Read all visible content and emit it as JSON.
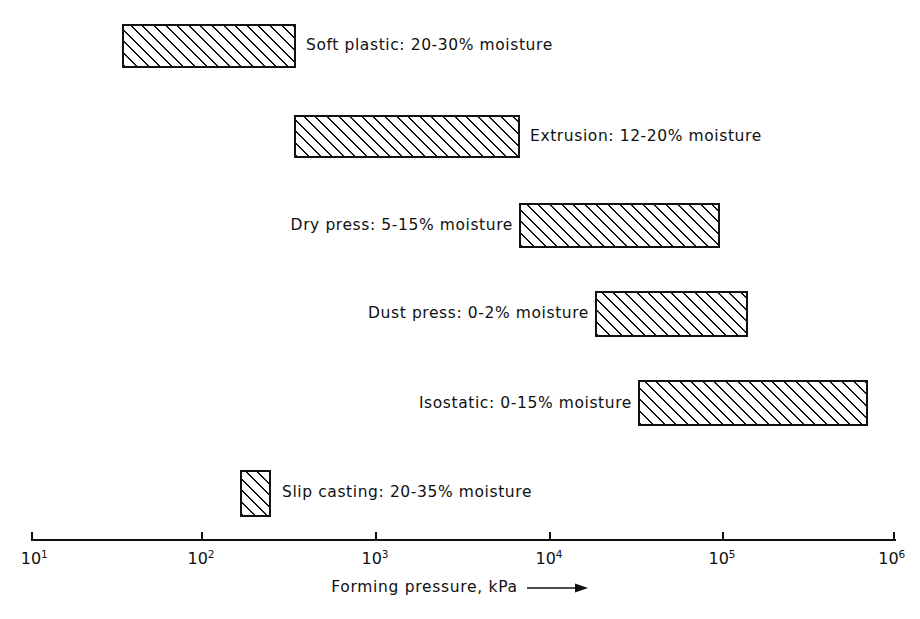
{
  "chart_data": {
    "type": "bar",
    "orientation": "horizontal",
    "title": "",
    "subtitle": "",
    "xlabel": "Forming pressure, kPa ⟶",
    "ylabel": "",
    "xscale": "log",
    "xlim": [
      10,
      1000000
    ],
    "grid": false,
    "legend": null,
    "xticks": [
      {
        "value": 10,
        "mantissa": "10",
        "exponent": "1",
        "px": 31
      },
      {
        "value": 100,
        "mantissa": "10",
        "exponent": "2",
        "px": 201
      },
      {
        "value": 1000,
        "mantissa": "10",
        "exponent": "3",
        "px": 375
      },
      {
        "value": 10000,
        "mantissa": "10",
        "exponent": "4",
        "px": 549
      },
      {
        "value": 100000,
        "mantissa": "10",
        "exponent": "5",
        "px": 722
      },
      {
        "value": 1000000,
        "mantissa": "10",
        "exponent": "6",
        "px": 895
      }
    ],
    "categories": [
      "Soft plastic",
      "Extrusion",
      "Dry press",
      "Dust press",
      "Isostatic",
      "Slip casting"
    ],
    "bars": [
      {
        "label": "Soft plastic: 20-30% moisture",
        "process": "Soft plastic",
        "moisture": "20-30%",
        "pressure_min_kpa": 34,
        "pressure_max_kpa": 340,
        "label_side": "right",
        "px": {
          "left": 122,
          "top": 24,
          "width": 174,
          "height": 44
        },
        "label_px": {
          "x": 306,
          "y": 38
        }
      },
      {
        "label": "Extrusion: 12-20% moisture",
        "process": "Extrusion",
        "moisture": "12-20%",
        "pressure_min_kpa": 320,
        "pressure_max_kpa": 6600,
        "label_side": "right",
        "px": {
          "left": 294,
          "top": 115,
          "width": 226,
          "height": 43
        },
        "label_px": {
          "x": 530,
          "y": 129
        }
      },
      {
        "label": "Dry press: 5-15% moisture",
        "process": "Dry press",
        "moisture": "5-15%",
        "pressure_min_kpa": 6400,
        "pressure_max_kpa": 120000,
        "label_side": "left",
        "px": {
          "left": 519,
          "top": 203,
          "width": 201,
          "height": 45
        },
        "label_px": {
          "x": 513,
          "y": 218
        }
      },
      {
        "label": "Dust press: 0-2% moisture",
        "process": "Dust press",
        "moisture": "0-2%",
        "pressure_min_kpa": 22000,
        "pressure_max_kpa": 100000,
        "label_side": "left",
        "px": {
          "left": 595,
          "top": 291,
          "width": 153,
          "height": 46
        },
        "label_px": {
          "x": 589,
          "y": 306
        }
      },
      {
        "label": "Isostatic: 0-15% moisture",
        "process": "Isostatic",
        "moisture": "0-15%",
        "pressure_min_kpa": 33000,
        "pressure_max_kpa": 620000,
        "label_side": "left",
        "px": {
          "left": 638,
          "top": 380,
          "width": 230,
          "height": 46
        },
        "label_px": {
          "x": 632,
          "y": 396
        }
      },
      {
        "label": "Slip casting: 20-35% moisture",
        "process": "Slip casting",
        "moisture": "20-35%",
        "pressure_min_kpa": 110,
        "pressure_max_kpa": 200,
        "label_side": "right",
        "px": {
          "left": 240,
          "top": 470,
          "width": 31,
          "height": 47
        },
        "label_px": {
          "x": 282,
          "y": 485
        }
      }
    ],
    "colors": {
      "line": "#111111",
      "text": "#101010",
      "background": "#ffffff",
      "hatch": "#111111"
    }
  },
  "axis": {
    "title": "Forming pressure, kPa",
    "arrow": "⟶"
  }
}
